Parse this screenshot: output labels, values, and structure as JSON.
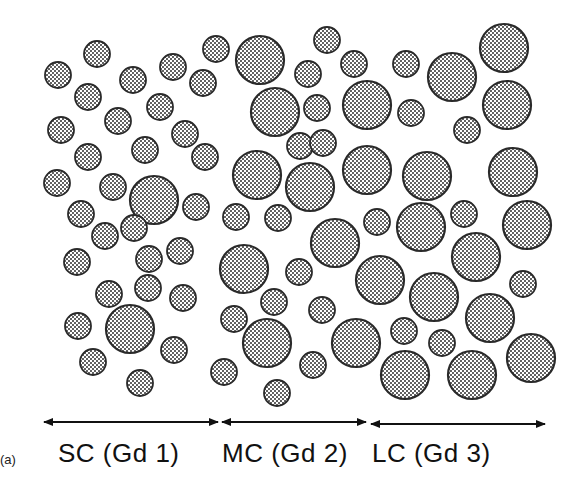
{
  "figure": {
    "panel_label": "(a)",
    "groups": [
      {
        "label": "SC (Gd 1)",
        "arrow": {
          "x1": 44,
          "x2": 218,
          "y": 422
        },
        "label_x": 58
      },
      {
        "label": "MC (Gd 2)",
        "arrow": {
          "x1": 222,
          "x2": 366,
          "y": 422
        },
        "label_x": 222
      },
      {
        "label": "LC (Gd 3)",
        "arrow": {
          "x1": 371,
          "x2": 545,
          "y": 424
        },
        "label_x": 372
      }
    ],
    "circle_style": {
      "fill_dot_color": "#222222",
      "stroke_color": "#2a2a2a",
      "background": "#ffffff"
    },
    "circles": [
      {
        "cx": 97,
        "cy": 54,
        "r": 13
      },
      {
        "cx": 58,
        "cy": 75,
        "r": 13
      },
      {
        "cx": 133,
        "cy": 80,
        "r": 13
      },
      {
        "cx": 173,
        "cy": 67,
        "r": 13
      },
      {
        "cx": 216,
        "cy": 49,
        "r": 13
      },
      {
        "cx": 88,
        "cy": 97,
        "r": 13
      },
      {
        "cx": 160,
        "cy": 107,
        "r": 13
      },
      {
        "cx": 203,
        "cy": 83,
        "r": 13
      },
      {
        "cx": 61,
        "cy": 130,
        "r": 13
      },
      {
        "cx": 118,
        "cy": 121,
        "r": 13
      },
      {
        "cx": 185,
        "cy": 134,
        "r": 13
      },
      {
        "cx": 88,
        "cy": 157,
        "r": 13
      },
      {
        "cx": 145,
        "cy": 150,
        "r": 13
      },
      {
        "cx": 205,
        "cy": 157,
        "r": 13
      },
      {
        "cx": 57,
        "cy": 183,
        "r": 13
      },
      {
        "cx": 113,
        "cy": 187,
        "r": 13
      },
      {
        "cx": 154,
        "cy": 200,
        "r": 24
      },
      {
        "cx": 196,
        "cy": 207,
        "r": 13
      },
      {
        "cx": 81,
        "cy": 214,
        "r": 13
      },
      {
        "cx": 105,
        "cy": 236,
        "r": 13
      },
      {
        "cx": 134,
        "cy": 228,
        "r": 13
      },
      {
        "cx": 180,
        "cy": 251,
        "r": 13
      },
      {
        "cx": 77,
        "cy": 262,
        "r": 13
      },
      {
        "cx": 149,
        "cy": 259,
        "r": 13
      },
      {
        "cx": 109,
        "cy": 294,
        "r": 13
      },
      {
        "cx": 148,
        "cy": 288,
        "r": 13
      },
      {
        "cx": 183,
        "cy": 298,
        "r": 13
      },
      {
        "cx": 130,
        "cy": 329,
        "r": 24
      },
      {
        "cx": 78,
        "cy": 326,
        "r": 13
      },
      {
        "cx": 174,
        "cy": 350,
        "r": 13
      },
      {
        "cx": 93,
        "cy": 362,
        "r": 13
      },
      {
        "cx": 140,
        "cy": 383,
        "r": 13
      },
      {
        "cx": 260,
        "cy": 60,
        "r": 24
      },
      {
        "cx": 327,
        "cy": 40,
        "r": 13
      },
      {
        "cx": 308,
        "cy": 74,
        "r": 13
      },
      {
        "cx": 354,
        "cy": 64,
        "r": 13
      },
      {
        "cx": 275,
        "cy": 112,
        "r": 24
      },
      {
        "cx": 317,
        "cy": 108,
        "r": 13
      },
      {
        "cx": 367,
        "cy": 105,
        "r": 24
      },
      {
        "cx": 300,
        "cy": 146,
        "r": 13
      },
      {
        "cx": 323,
        "cy": 143,
        "r": 13
      },
      {
        "cx": 257,
        "cy": 175,
        "r": 24
      },
      {
        "cx": 310,
        "cy": 187,
        "r": 24
      },
      {
        "cx": 367,
        "cy": 170,
        "r": 24
      },
      {
        "cx": 236,
        "cy": 217,
        "r": 13
      },
      {
        "cx": 278,
        "cy": 218,
        "r": 13
      },
      {
        "cx": 335,
        "cy": 243,
        "r": 24
      },
      {
        "cx": 244,
        "cy": 269,
        "r": 24
      },
      {
        "cx": 299,
        "cy": 272,
        "r": 13
      },
      {
        "cx": 274,
        "cy": 302,
        "r": 13
      },
      {
        "cx": 234,
        "cy": 319,
        "r": 13
      },
      {
        "cx": 322,
        "cy": 310,
        "r": 13
      },
      {
        "cx": 267,
        "cy": 343,
        "r": 24
      },
      {
        "cx": 356,
        "cy": 343,
        "r": 24
      },
      {
        "cx": 224,
        "cy": 372,
        "r": 13
      },
      {
        "cx": 313,
        "cy": 365,
        "r": 13
      },
      {
        "cx": 277,
        "cy": 393,
        "r": 13
      },
      {
        "cx": 406,
        "cy": 64,
        "r": 13
      },
      {
        "cx": 452,
        "cy": 77,
        "r": 24
      },
      {
        "cx": 504,
        "cy": 48,
        "r": 24
      },
      {
        "cx": 411,
        "cy": 113,
        "r": 13
      },
      {
        "cx": 467,
        "cy": 130,
        "r": 13
      },
      {
        "cx": 507,
        "cy": 105,
        "r": 24
      },
      {
        "cx": 377,
        "cy": 222,
        "r": 13
      },
      {
        "cx": 421,
        "cy": 227,
        "r": 24
      },
      {
        "cx": 464,
        "cy": 214,
        "r": 13
      },
      {
        "cx": 513,
        "cy": 172,
        "r": 24
      },
      {
        "cx": 427,
        "cy": 176,
        "r": 24
      },
      {
        "cx": 527,
        "cy": 225,
        "r": 24
      },
      {
        "cx": 380,
        "cy": 280,
        "r": 24
      },
      {
        "cx": 434,
        "cy": 297,
        "r": 24
      },
      {
        "cx": 476,
        "cy": 257,
        "r": 24
      },
      {
        "cx": 523,
        "cy": 284,
        "r": 13
      },
      {
        "cx": 490,
        "cy": 318,
        "r": 24
      },
      {
        "cx": 404,
        "cy": 331,
        "r": 13
      },
      {
        "cx": 442,
        "cy": 343,
        "r": 13
      },
      {
        "cx": 405,
        "cy": 375,
        "r": 24
      },
      {
        "cx": 472,
        "cy": 375,
        "r": 24
      },
      {
        "cx": 531,
        "cy": 358,
        "r": 24
      },
      {
        "cx": 351,
        "cy": 340,
        "r": 0
      }
    ]
  }
}
